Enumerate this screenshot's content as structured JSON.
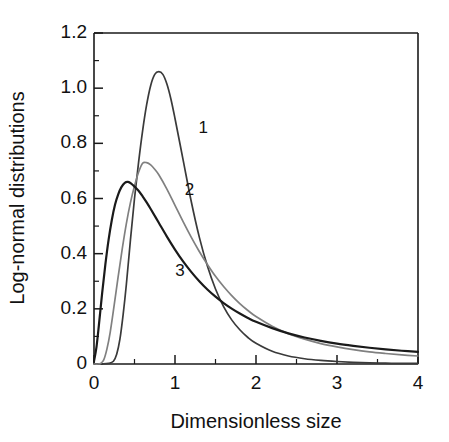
{
  "chart_data": {
    "type": "line",
    "title": "",
    "subtitle": "",
    "xlabel": "Dimensionless size",
    "ylabel": "Log-normal distributions",
    "xlim": [
      0,
      4
    ],
    "ylim": [
      0,
      1.2
    ],
    "grid": false,
    "legend_position": "inline-annotations",
    "x_ticks": [
      0,
      1,
      2,
      3,
      4
    ],
    "x_tick_labels": [
      "0",
      "1",
      "2",
      "3",
      "4"
    ],
    "x_minor_ticks": [
      0.5,
      1.5,
      2.5,
      3.5
    ],
    "y_ticks": [
      0,
      0.2,
      0.4,
      0.6,
      0.8,
      1.0,
      1.2
    ],
    "y_tick_labels": [
      "0",
      "0.2",
      "0.4",
      "0.6",
      "0.8",
      "1.0",
      "1.2"
    ],
    "y_minor_ticks": [
      0.1,
      0.3,
      0.5,
      0.7,
      0.9,
      1.1
    ],
    "annotations": [
      {
        "text": "1",
        "x": 1.35,
        "y": 0.855
      },
      {
        "text": "2",
        "x": 1.18,
        "y": 0.63
      },
      {
        "text": "3",
        "x": 1.06,
        "y": 0.335
      }
    ],
    "series": [
      {
        "name": "1",
        "color": "#3a3a3a",
        "width": 1.7,
        "peak_x": 0.82,
        "peak_y": 1.06,
        "x": [
          0.0,
          0.1,
          0.18,
          0.24,
          0.28,
          0.32,
          0.36,
          0.4,
          0.45,
          0.5,
          0.55,
          0.6,
          0.65,
          0.7,
          0.75,
          0.8,
          0.85,
          0.9,
          0.95,
          1.0,
          1.1,
          1.2,
          1.3,
          1.4,
          1.5,
          1.6,
          1.7,
          1.8,
          1.9,
          2.0,
          2.2,
          2.4,
          2.6,
          2.8,
          3.0,
          3.2,
          3.4,
          3.6,
          3.8,
          4.0
        ],
        "y": [
          0.0,
          0.0,
          0.002,
          0.01,
          0.035,
          0.09,
          0.18,
          0.29,
          0.45,
          0.6,
          0.73,
          0.845,
          0.94,
          1.01,
          1.05,
          1.06,
          1.05,
          1.015,
          0.96,
          0.89,
          0.74,
          0.59,
          0.46,
          0.355,
          0.272,
          0.208,
          0.16,
          0.124,
          0.096,
          0.075,
          0.046,
          0.029,
          0.019,
          0.013,
          0.009,
          0.006,
          0.004,
          0.003,
          0.002,
          0.002
        ]
      },
      {
        "name": "2",
        "color": "#808080",
        "width": 1.7,
        "peak_x": 0.6,
        "peak_y": 0.73,
        "x": [
          0.0,
          0.05,
          0.08,
          0.12,
          0.16,
          0.2,
          0.25,
          0.3,
          0.35,
          0.4,
          0.45,
          0.5,
          0.55,
          0.6,
          0.65,
          0.7,
          0.75,
          0.8,
          0.9,
          1.0,
          1.1,
          1.2,
          1.3,
          1.4,
          1.5,
          1.6,
          1.7,
          1.8,
          1.9,
          2.0,
          2.2,
          2.4,
          2.6,
          2.8,
          3.0,
          3.2,
          3.4,
          3.6,
          3.8,
          4.0
        ],
        "y": [
          0.0,
          0.0,
          0.002,
          0.015,
          0.055,
          0.115,
          0.215,
          0.32,
          0.42,
          0.51,
          0.585,
          0.645,
          0.695,
          0.728,
          0.73,
          0.722,
          0.706,
          0.686,
          0.634,
          0.575,
          0.516,
          0.46,
          0.408,
          0.361,
          0.318,
          0.281,
          0.248,
          0.219,
          0.194,
          0.172,
          0.137,
          0.11,
          0.09,
          0.074,
          0.062,
          0.052,
          0.044,
          0.038,
          0.033,
          0.029
        ]
      },
      {
        "name": "3",
        "color": "#1a1a1a",
        "width": 2.2,
        "peak_x": 0.42,
        "peak_y": 0.66,
        "x": [
          0.0,
          0.03,
          0.06,
          0.1,
          0.14,
          0.18,
          0.22,
          0.26,
          0.3,
          0.34,
          0.38,
          0.42,
          0.46,
          0.5,
          0.55,
          0.6,
          0.65,
          0.7,
          0.8,
          0.9,
          1.0,
          1.1,
          1.2,
          1.3,
          1.4,
          1.5,
          1.6,
          1.7,
          1.8,
          1.9,
          2.0,
          2.2,
          2.4,
          2.6,
          2.8,
          3.0,
          3.2,
          3.4,
          3.6,
          3.8,
          4.0
        ],
        "y": [
          0.01,
          0.06,
          0.14,
          0.255,
          0.36,
          0.45,
          0.522,
          0.578,
          0.616,
          0.642,
          0.657,
          0.66,
          0.654,
          0.643,
          0.628,
          0.608,
          0.586,
          0.562,
          0.512,
          0.462,
          0.415,
          0.372,
          0.334,
          0.3,
          0.27,
          0.244,
          0.221,
          0.201,
          0.183,
          0.167,
          0.153,
          0.13,
          0.111,
          0.096,
          0.084,
          0.074,
          0.066,
          0.059,
          0.053,
          0.048,
          0.044
        ]
      }
    ]
  },
  "figure": {
    "background_color": "#ffffff",
    "axis_color": "#1a1a1a"
  }
}
